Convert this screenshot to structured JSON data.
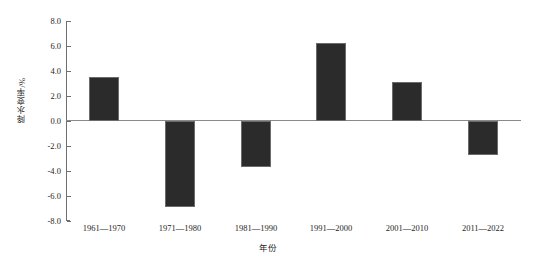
{
  "chart_data": {
    "type": "bar",
    "title": "",
    "subtitle": "",
    "xlabel": "年份",
    "ylabel": "降水变率/%",
    "categories": [
      "1961—1970",
      "1971—1980",
      "1981—1990",
      "1991—2000",
      "2001—2010",
      "2011—2022"
    ],
    "values": [
      3.5,
      -6.9,
      -3.7,
      6.2,
      3.1,
      -2.7
    ],
    "series": [
      {
        "name": "降水变率",
        "values": [
          3.5,
          -6.9,
          -3.7,
          6.2,
          3.1,
          -2.7
        ]
      }
    ],
    "ylim": [
      -8.0,
      8.0
    ],
    "ytick_values": [
      8.0,
      6.0,
      4.0,
      2.0,
      0.0,
      -2.0,
      -4.0,
      -6.0,
      -8.0
    ],
    "ytick_labels": [
      "8.0",
      "6.0",
      "4.0",
      "2.0",
      "0.0",
      "-2.0",
      "-4.0",
      "-6.0",
      "-8.0"
    ],
    "grid": false,
    "legend": null,
    "legend_position": "none",
    "bar_color": "#2b2b2b",
    "bar_edge_color": "#6b6b6b",
    "axis_color": "#6e6e6e",
    "zero_line_color": "#8a8a8a",
    "background_color": "#ffffff",
    "annotations": []
  }
}
